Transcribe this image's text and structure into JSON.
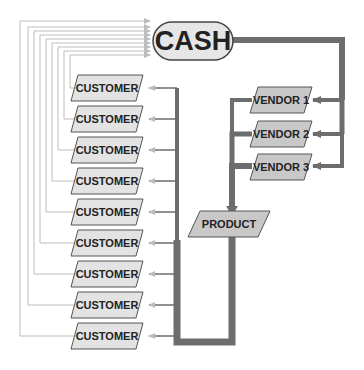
{
  "diagram": {
    "type": "cash-flow",
    "colors": {
      "thick_line": "#6d6d6d",
      "thin_line": "#bdbdbd",
      "box_fill": "#c8c8c8",
      "cash_fill": "#e6e6e6",
      "box_stroke": "#555555",
      "text": "#222222"
    },
    "cash": {
      "label": "CASH"
    },
    "vendors": [
      {
        "label": "VENDOR 1"
      },
      {
        "label": "VENDOR 2"
      },
      {
        "label": "VENDOR 3"
      }
    ],
    "product": {
      "label": "PRODUCT"
    },
    "customers": [
      {
        "label": "CUSTOMER"
      },
      {
        "label": "CUSTOMER"
      },
      {
        "label": "CUSTOMER"
      },
      {
        "label": "CUSTOMER"
      },
      {
        "label": "CUSTOMER"
      },
      {
        "label": "CUSTOMER"
      },
      {
        "label": "CUSTOMER"
      },
      {
        "label": "CUSTOMER"
      },
      {
        "label": "CUSTOMER"
      }
    ],
    "flows": [
      {
        "from": "CASH",
        "to": "VENDOR 1"
      },
      {
        "from": "CASH",
        "to": "VENDOR 2"
      },
      {
        "from": "CASH",
        "to": "VENDOR 3"
      },
      {
        "from": "VENDORS",
        "to": "PRODUCT"
      },
      {
        "from": "PRODUCT",
        "to": "CUSTOMER (x9)"
      },
      {
        "from": "CUSTOMER (x9)",
        "to": "CASH"
      }
    ]
  }
}
